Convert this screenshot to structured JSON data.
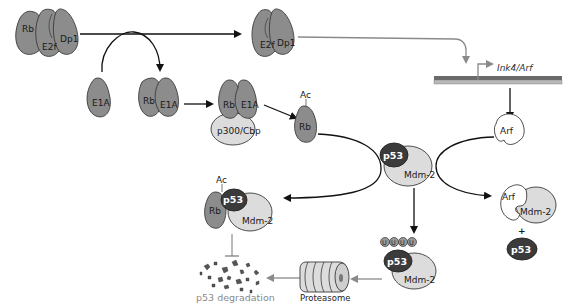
{
  "diagram": {
    "colors": {
      "protein_gray": "#8c8c8c",
      "light_gray": "#dcdcdc",
      "p53_dark": "#3b3b3b",
      "arrow_black": "#111111",
      "arrow_gray": "#8a8a8a",
      "dna_top": "#6a6a6a",
      "dna_bottom": "#b8b8b8"
    },
    "nodes": {
      "rb_e2f_dp1": {
        "rb": "Rb",
        "e2f": "E2f",
        "dp1": "Dp1"
      },
      "free_e2f_dp1": {
        "e2f": "E2f",
        "dp1": "Dp1"
      },
      "e1a": {
        "label": "E1A"
      },
      "rb_e1a": {
        "rb": "Rb",
        "e1a": "E1A"
      },
      "rb_e1a_p300": {
        "rb": "Rb",
        "e1a": "E1A",
        "p300": "p300/Cbp"
      },
      "rb_ac": {
        "rb": "Rb",
        "ac": "Ac"
      },
      "gene": {
        "label": "Ink4/Arf"
      },
      "arf_free": {
        "label": "Arf"
      },
      "p53_mdm2": {
        "p53": "p53",
        "mdm2": "Mdm-2"
      },
      "rb_p53_mdm2": {
        "ac": "Ac",
        "rb": "Rb",
        "p53": "p53",
        "mdm2": "Mdm-2"
      },
      "arf_mdm2": {
        "arf": "Arf",
        "mdm2": "Mdm-2",
        "plus": "+",
        "p53": "p53"
      },
      "ub_p53_mdm2": {
        "ub": [
          "U",
          "U",
          "U",
          "U"
        ],
        "p53": "p53",
        "mdm2": "Mdm-2"
      },
      "proteasome": {
        "label": "Proteasome"
      },
      "degradation": {
        "label": "p53 degradation"
      }
    }
  }
}
